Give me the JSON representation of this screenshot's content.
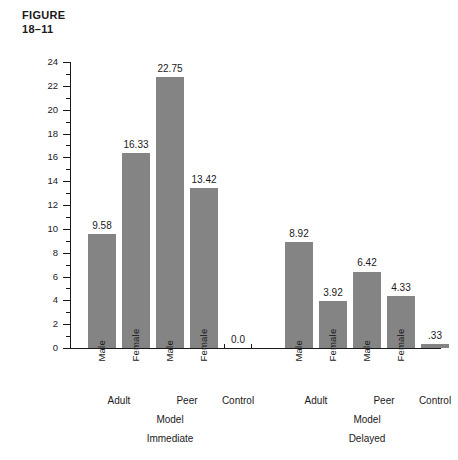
{
  "figure": {
    "label_line1": "FIGURE",
    "label_line2": "18–11"
  },
  "chart_data": {
    "type": "bar",
    "title": "",
    "xlabel": "Model",
    "ylabel": "Average imitative aggression scores",
    "ylim": [
      0,
      24
    ],
    "ytick_step": 2,
    "yminor_step": 1,
    "grid": false,
    "legend": null,
    "bar_color": "#848484",
    "categories": [
      "Adult Male",
      "Adult Female",
      "Peer Male",
      "Peer Female",
      "Control",
      "Adult Male",
      "Adult Female",
      "Peer Male",
      "Peer Female",
      "Control"
    ],
    "values": [
      9.58,
      16.33,
      22.75,
      13.42,
      0.0,
      8.92,
      3.92,
      6.42,
      4.33,
      0.33
    ],
    "value_labels": [
      "9.58",
      "16.33",
      "22.75",
      "13.42",
      "0.0",
      "8.92",
      "3.92",
      "6.42",
      "4.33",
      ".33"
    ],
    "ytick_labels": [
      "0",
      "2",
      "4",
      "6",
      "8",
      "10",
      "12",
      "14",
      "16",
      "18",
      "20",
      "22",
      "24"
    ],
    "groups": [
      {
        "condition": "Immediate",
        "model_axis_label": "Model",
        "model_types": [
          "Adult",
          "Peer",
          "Control"
        ],
        "sex_labels": [
          "Male",
          "Female",
          "Male",
          "Female"
        ],
        "bars": [
          {
            "sex": "Male",
            "model": "Adult",
            "value": 9.58,
            "label": "9.58"
          },
          {
            "sex": "Female",
            "model": "Adult",
            "value": 16.33,
            "label": "16.33"
          },
          {
            "sex": "Male",
            "model": "Peer",
            "value": 22.75,
            "label": "22.75"
          },
          {
            "sex": "Female",
            "model": "Peer",
            "value": 13.42,
            "label": "13.42"
          },
          {
            "sex": "",
            "model": "Control",
            "value": 0.0,
            "label": "0.0"
          }
        ]
      },
      {
        "condition": "Delayed",
        "model_axis_label": "Model",
        "model_types": [
          "Adult",
          "Peer",
          "Control"
        ],
        "sex_labels": [
          "Male",
          "Female",
          "Male",
          "Female"
        ],
        "bars": [
          {
            "sex": "Male",
            "model": "Adult",
            "value": 8.92,
            "label": "8.92"
          },
          {
            "sex": "Female",
            "model": "Adult",
            "value": 3.92,
            "label": "3.92"
          },
          {
            "sex": "Male",
            "model": "Peer",
            "value": 6.42,
            "label": "6.42"
          },
          {
            "sex": "Female",
            "model": "Peer",
            "value": 4.33,
            "label": "4.33"
          },
          {
            "sex": "",
            "model": "Control",
            "value": 0.33,
            "label": ".33"
          }
        ]
      }
    ]
  },
  "axis": {
    "y_title": "Average imitative aggression scores"
  }
}
